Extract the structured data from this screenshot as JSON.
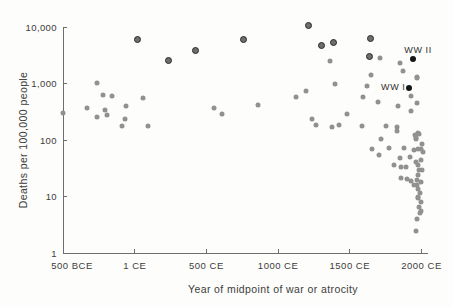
{
  "figure": {
    "y_axis_label": "Deaths per 100,000 people",
    "x_axis_label": "Year of midpoint of war or atrocity"
  },
  "colors": {
    "point_regular": "#919191",
    "point_major_fill": "#6e6e6e",
    "point_major_ring": "#2a2a2a",
    "point_world_war": "#151515",
    "axis": "#6e6e6e",
    "text": "#3c3c3c"
  },
  "chart_data": {
    "type": "scatter",
    "title": "",
    "xlabel": "Year of midpoint of war or atrocity",
    "ylabel": "Deaths per 100,000 people",
    "x_scale": "linear",
    "y_scale": "log",
    "xlim": [
      -500,
      2060
    ],
    "ylim": [
      1,
      12000
    ],
    "grid": false,
    "x_ticks": [
      {
        "label": "500 BCE",
        "year": -500
      },
      {
        "label": "1 CE",
        "year": 1
      },
      {
        "label": "500 CE",
        "year": 500
      },
      {
        "label": "1000 CE",
        "year": 1000
      },
      {
        "label": "1500 CE",
        "year": 1500
      },
      {
        "label": "2000 CE",
        "year": 2000
      }
    ],
    "y_ticks": [
      {
        "label": "10,000",
        "value": 10000
      },
      {
        "label": "1,000",
        "value": 1000
      },
      {
        "label": "100",
        "value": 100
      },
      {
        "label": "10",
        "value": 10
      },
      {
        "label": "1",
        "value": 1
      }
    ],
    "annotations": [
      {
        "text": "WW II",
        "year": 1943,
        "value": 2700,
        "placement": "above-right"
      },
      {
        "text": "WW I",
        "year": 1916,
        "value": 840,
        "placement": "left"
      }
    ],
    "points": [
      [
        -500,
        300,
        "r"
      ],
      [
        -330,
        370,
        "r"
      ],
      [
        -260,
        1040,
        "r"
      ],
      [
        -260,
        255,
        "r"
      ],
      [
        -220,
        640,
        "r"
      ],
      [
        -210,
        345,
        "r"
      ],
      [
        -190,
        280,
        "r"
      ],
      [
        -160,
        610,
        "r"
      ],
      [
        -90,
        180,
        "r"
      ],
      [
        -70,
        240,
        "r"
      ],
      [
        -60,
        400,
        "r"
      ],
      [
        60,
        560,
        "r"
      ],
      [
        95,
        180,
        "r"
      ],
      [
        550,
        370,
        "r"
      ],
      [
        610,
        290,
        "r"
      ],
      [
        860,
        420,
        "r"
      ],
      [
        1125,
        575,
        "r"
      ],
      [
        1195,
        750,
        "r"
      ],
      [
        1235,
        240,
        "r"
      ],
      [
        1265,
        185,
        "r"
      ],
      [
        1365,
        2500,
        "r"
      ],
      [
        1375,
        175,
        "r"
      ],
      [
        1400,
        980,
        "r"
      ],
      [
        1425,
        190,
        "r"
      ],
      [
        1480,
        290,
        "r"
      ],
      [
        1585,
        180,
        "r"
      ],
      [
        1590,
        590,
        "r"
      ],
      [
        1620,
        920,
        "r"
      ],
      [
        1645,
        1450,
        "r"
      ],
      [
        1655,
        70,
        "r"
      ],
      [
        1700,
        480,
        "r"
      ],
      [
        1705,
        55,
        "r"
      ],
      [
        1710,
        2800,
        "r"
      ],
      [
        1715,
        105,
        "r"
      ],
      [
        1755,
        180,
        "r"
      ],
      [
        1770,
        74,
        "r"
      ],
      [
        1810,
        37,
        "r"
      ],
      [
        1827,
        175,
        "r"
      ],
      [
        1830,
        145,
        "r"
      ],
      [
        1838,
        405,
        "r"
      ],
      [
        1850,
        2320,
        "r"
      ],
      [
        1850,
        48,
        "r"
      ],
      [
        1855,
        34,
        "r"
      ],
      [
        1860,
        22,
        "r"
      ],
      [
        1869,
        1660,
        "r"
      ],
      [
        1875,
        73,
        "r"
      ],
      [
        1890,
        34,
        "r"
      ],
      [
        1900,
        21,
        "r"
      ],
      [
        1920,
        50,
        "r"
      ],
      [
        1925,
        330,
        "r"
      ],
      [
        1928,
        600,
        "r"
      ],
      [
        1930,
        19,
        "r"
      ],
      [
        1945,
        16,
        "r"
      ],
      [
        1950,
        67,
        "r"
      ],
      [
        1955,
        124,
        "r"
      ],
      [
        1960,
        108,
        "r"
      ],
      [
        1960,
        2.5,
        "r"
      ],
      [
        1962,
        104,
        "r"
      ],
      [
        1965,
        41,
        "r"
      ],
      [
        1966,
        1330,
        "r"
      ],
      [
        1966,
        20,
        "r"
      ],
      [
        1966,
        4,
        "r"
      ],
      [
        1967,
        460,
        "r"
      ],
      [
        1970,
        16,
        "r"
      ],
      [
        1971,
        1260,
        "r"
      ],
      [
        1974,
        135,
        "r"
      ],
      [
        1974,
        70,
        "r"
      ],
      [
        1974,
        37,
        "r"
      ],
      [
        1975,
        9.5,
        "r"
      ],
      [
        1978,
        24,
        "r"
      ],
      [
        1978,
        14,
        "r"
      ],
      [
        1978,
        10,
        "r"
      ],
      [
        1985,
        127,
        "r"
      ],
      [
        1985,
        30,
        "r"
      ],
      [
        1985,
        6.7,
        "r"
      ],
      [
        1990,
        11.6,
        "r"
      ],
      [
        1990,
        5.1,
        "r"
      ],
      [
        1994,
        5.6,
        "r"
      ],
      [
        1995,
        70,
        "r"
      ],
      [
        1997,
        45,
        "r"
      ],
      [
        1997,
        18,
        "r"
      ],
      [
        1997,
        8,
        "r"
      ],
      [
        2002,
        86,
        "r"
      ],
      [
        2006,
        30,
        "r"
      ],
      [
        2013,
        63,
        "r"
      ],
      [
        20,
        5900,
        "m"
      ],
      [
        240,
        2550,
        "m"
      ],
      [
        425,
        3800,
        "m"
      ],
      [
        760,
        5900,
        "m"
      ],
      [
        1215,
        10500,
        "m"
      ],
      [
        1305,
        4700,
        "m"
      ],
      [
        1390,
        5200,
        "m"
      ],
      [
        1640,
        3000,
        "m"
      ],
      [
        1645,
        6200,
        "m"
      ],
      [
        1943,
        2700,
        "w"
      ],
      [
        1916,
        840,
        "w"
      ]
    ]
  }
}
